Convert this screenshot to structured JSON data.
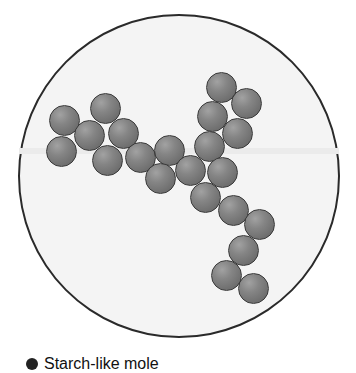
{
  "figure": {
    "type": "molecule-diagram",
    "container": "circle",
    "colors": {
      "ball": "#7a7a7a",
      "outline": "#2a2a2a",
      "background": "#f4f4f4"
    },
    "balls": [
      {
        "x": 64,
        "y": 120
      },
      {
        "x": 105,
        "y": 108
      },
      {
        "x": 89,
        "y": 135
      },
      {
        "x": 123,
        "y": 133
      },
      {
        "x": 61,
        "y": 151
      },
      {
        "x": 107,
        "y": 160
      },
      {
        "x": 140,
        "y": 157
      },
      {
        "x": 169,
        "y": 150
      },
      {
        "x": 160,
        "y": 178
      },
      {
        "x": 221,
        "y": 87
      },
      {
        "x": 246,
        "y": 103
      },
      {
        "x": 212,
        "y": 116
      },
      {
        "x": 237,
        "y": 133
      },
      {
        "x": 209,
        "y": 146
      },
      {
        "x": 190,
        "y": 170
      },
      {
        "x": 222,
        "y": 172
      },
      {
        "x": 205,
        "y": 197
      },
      {
        "x": 233,
        "y": 210
      },
      {
        "x": 259,
        "y": 224
      },
      {
        "x": 243,
        "y": 250
      },
      {
        "x": 226,
        "y": 275
      },
      {
        "x": 253,
        "y": 288
      }
    ]
  },
  "legend": {
    "label": "Starch-like mole"
  }
}
